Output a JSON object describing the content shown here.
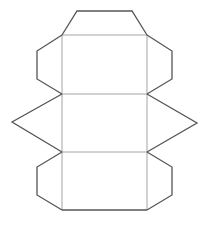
{
  "diagram": {
    "type": "geometric-net",
    "colors": {
      "outline": "#555555",
      "fold_lines": "#9a9a9a",
      "background": "#ffffff"
    },
    "faces": [
      {
        "name": "top-trapezoid",
        "points": "62,35 77,11 132,11 147,35"
      },
      {
        "name": "upper-rectangle",
        "points": "62,35 147,35 147,94 62,94"
      },
      {
        "name": "upper-left-flap",
        "points": "62,35 37,51 37,79 62,94"
      },
      {
        "name": "upper-right-flap",
        "points": "147,35 172,51 172,79 147,94"
      },
      {
        "name": "left-triangle",
        "points": "62,94 12,122 62,152"
      },
      {
        "name": "middle-rectangle",
        "points": "62,94 147,94 147,152 62,152"
      },
      {
        "name": "right-triangle",
        "points": "147,94 197,123 147,152"
      },
      {
        "name": "lower-rectangle",
        "points": "62,152 147,152 147,210 62,210"
      },
      {
        "name": "lower-left-flap",
        "points": "62,152 37,167 37,195 62,210"
      },
      {
        "name": "lower-right-flap",
        "points": "147,152 172,167 172,195 147,210"
      }
    ]
  }
}
